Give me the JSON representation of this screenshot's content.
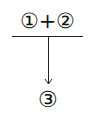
{
  "diagram": {
    "top_expression": {
      "left_operand": "①",
      "operator": "+",
      "right_operand": "②"
    },
    "result": "③",
    "colors": {
      "ink": "#111111",
      "background": "#ffffff"
    }
  }
}
